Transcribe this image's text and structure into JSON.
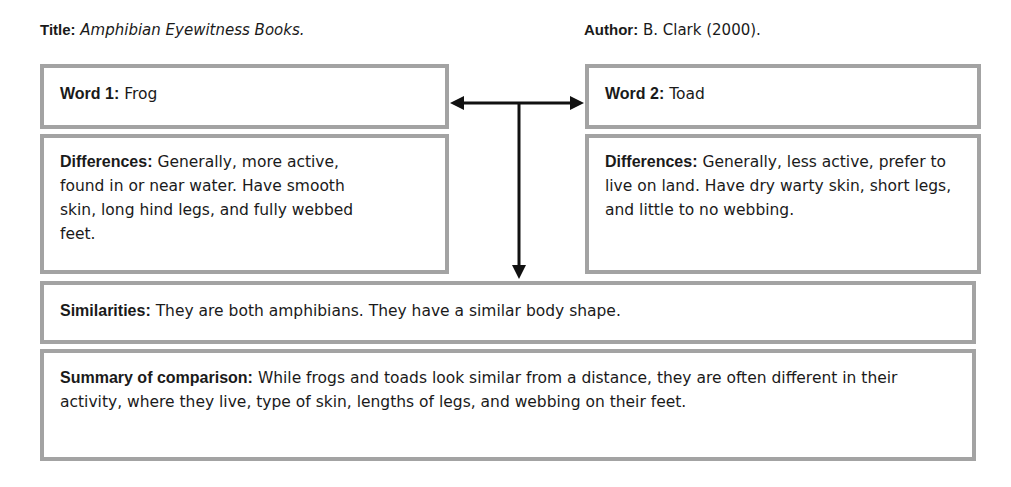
{
  "header": {
    "title_label": "Title:",
    "title_value": "Amphibian Eyewitness Books.",
    "author_label": "Author:",
    "author_value": "B. Clark (2000)."
  },
  "word1": {
    "label": "Word 1:",
    "value": "Frog"
  },
  "word2": {
    "label": "Word 2:",
    "value": "Toad"
  },
  "differences1": {
    "label": "Differences:",
    "text": "Generally, more active, found in or near water. Have smooth skin, long hind legs, and fully webbed feet."
  },
  "differences2": {
    "label": "Differences:",
    "text": "Generally, less active, prefer to live on land. Have dry warty skin, short legs, and little to no webbing."
  },
  "similarities": {
    "label": "Similarities:",
    "text": "They are both amphibians. They have a similar body shape."
  },
  "summary": {
    "label": "Summary of comparison:",
    "text": "While frogs and toads look similar from a distance, they are often different in their activity, where they live, type of skin, lengths of legs, and webbing on their feet."
  },
  "colors": {
    "box_border": "#a3a3a3",
    "arrow": "#111111",
    "text": "#1a1a1a"
  }
}
